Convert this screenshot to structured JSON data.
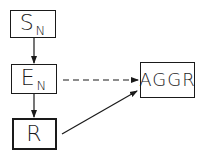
{
  "diagram": {
    "nodes": [
      {
        "id": "sn",
        "main": "S",
        "sub": "N"
      },
      {
        "id": "en",
        "main": "E",
        "sub": "N"
      },
      {
        "id": "r",
        "main": "R"
      },
      {
        "id": "aggr",
        "main": "AGGR"
      }
    ],
    "edges": [
      {
        "from": "sn",
        "to": "en",
        "style": "solid"
      },
      {
        "from": "en",
        "to": "r",
        "style": "solid"
      },
      {
        "from": "en",
        "to": "aggr",
        "style": "dashed"
      },
      {
        "from": "r",
        "to": "aggr",
        "style": "solid"
      }
    ],
    "colors": {
      "ink": "#1a1a1a",
      "background": "#ffffff"
    }
  }
}
